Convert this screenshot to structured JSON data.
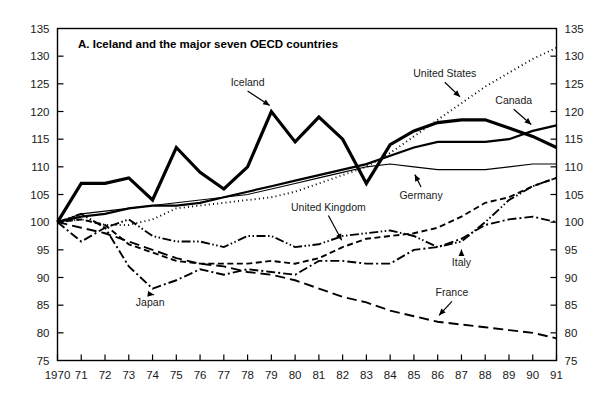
{
  "chart_data": {
    "type": "line",
    "title": "A.   Iceland and the major seven OECD countries",
    "title_prefix": "A.",
    "title_text": "Iceland and the major seven OECD countries",
    "xlabel": "",
    "ylabel": "",
    "xlim": [
      1970,
      1991
    ],
    "ylim": [
      75,
      135
    ],
    "grid": false,
    "legend_position": "inline-annotations",
    "y_ticks": [
      75,
      80,
      85,
      90,
      95,
      100,
      105,
      110,
      115,
      120,
      125,
      130,
      135
    ],
    "y_tick_labels": [
      "75",
      "80",
      "85",
      "90",
      "95",
      "100",
      "105",
      "110",
      "115",
      "120",
      "125",
      "130",
      "135"
    ],
    "y_axis_both_sides": true,
    "x": [
      1970,
      1971,
      1972,
      1973,
      1974,
      1975,
      1976,
      1977,
      1978,
      1979,
      1980,
      1981,
      1982,
      1983,
      1984,
      1985,
      1986,
      1987,
      1988,
      1989,
      1990,
      1991
    ],
    "x_tick_labels": [
      "1970",
      "71",
      "72",
      "73",
      "74",
      "75",
      "76",
      "77",
      "78",
      "79",
      "80",
      "81",
      "82",
      "83",
      "84",
      "85",
      "86",
      "87",
      "88",
      "89",
      "90",
      "91"
    ],
    "series": [
      {
        "name": "Iceland",
        "label": "Iceland",
        "style": "solid-thick",
        "stroke_width": 3.2,
        "dash": "none",
        "values": [
          100,
          107,
          107,
          108,
          104,
          113.5,
          109,
          106,
          110,
          120,
          114.5,
          119,
          115,
          107,
          114,
          116.5,
          118,
          118.5,
          118.5,
          117,
          115.5,
          113.5
        ],
        "annotation": {
          "text": "Iceland",
          "x": 1978.0,
          "y": 124.6
        }
      },
      {
        "name": "United States",
        "label": "United States",
        "style": "dotted",
        "stroke_width": 1.9,
        "dash": "1,3.2",
        "values": [
          100,
          100.5,
          99.5,
          99.5,
          100.5,
          102.5,
          103,
          103.5,
          104,
          104.5,
          105.5,
          107,
          108.5,
          110,
          112.5,
          115.5,
          118.5,
          121.5,
          124.5,
          127,
          129.5,
          131.5
        ],
        "annotation": {
          "text": "United States",
          "x": 1986.3,
          "y": 126.2
        }
      },
      {
        "name": "Canada",
        "label": "Canada",
        "style": "solid-medium",
        "stroke_width": 2.2,
        "dash": "none",
        "values": [
          100,
          101,
          101.5,
          102.5,
          103,
          103,
          103.5,
          104.5,
          105.5,
          106.5,
          107.5,
          108.5,
          109.5,
          110.5,
          112,
          113.5,
          114.5,
          114.5,
          114.5,
          115,
          116.5,
          117.5
        ],
        "annotation": {
          "text": "Canada",
          "x": 1989.2,
          "y": 121.3
        }
      },
      {
        "name": "Germany",
        "label": "Germany",
        "style": "solid-thin",
        "stroke_width": 1.1,
        "dash": "none",
        "values": [
          100,
          101.5,
          102,
          102.5,
          103,
          103.5,
          104,
          104.5,
          105,
          106,
          107,
          108,
          109,
          110,
          110.5,
          110,
          109.5,
          109.5,
          109.5,
          110,
          110.5,
          110.5
        ],
        "annotation": {
          "text": "Germany",
          "x": 1985.3,
          "y": 104.2
        }
      },
      {
        "name": "United Kingdom",
        "label": "United Kingdom",
        "style": "dashed-short",
        "stroke_width": 1.9,
        "dash": "6,3.5",
        "values": [
          100,
          100.5,
          99.5,
          96,
          94.5,
          93,
          92.5,
          92.5,
          92.5,
          93,
          92.5,
          93.5,
          95.5,
          97,
          97.5,
          98,
          99,
          101,
          103.5,
          104.5,
          106.5,
          108
        ],
        "annotation": {
          "text": "United Kingdom",
          "x": 1981.4,
          "y": 102.1
        }
      },
      {
        "name": "France",
        "label": "France",
        "style": "dashed-long",
        "stroke_width": 1.9,
        "dash": "10,5",
        "values": [
          100,
          99,
          98,
          96.5,
          95,
          93.5,
          92.5,
          92,
          91,
          90.5,
          89.5,
          88,
          86.5,
          85.5,
          84,
          83,
          82,
          81.5,
          81,
          80.5,
          80,
          79
        ],
        "annotation": {
          "text": "France",
          "x": 1986.6,
          "y": 86.6
        }
      },
      {
        "name": "Japan",
        "label": "Japan",
        "style": "dash-dot",
        "stroke_width": 1.9,
        "dash": "9,3,2,3",
        "values": [
          100,
          96.5,
          99,
          92,
          88,
          89.5,
          91.5,
          90.5,
          91.5,
          91,
          90.5,
          93,
          93,
          92.5,
          92.5,
          95,
          95.5,
          97,
          99.5,
          100.5,
          101,
          100
        ],
        "annotation": {
          "text": "Japan",
          "x": 1973.9,
          "y": 84.8
        }
      },
      {
        "name": "Italy",
        "label": "Italy",
        "style": "dash-dot-dot",
        "stroke_width": 1.9,
        "dash": "9,2.5,1.5,2.5,1.5,2.5",
        "values": [
          100,
          101.5,
          99,
          100.5,
          97.5,
          96.5,
          96.5,
          95.5,
          97.5,
          97.5,
          95.5,
          96,
          97.5,
          98,
          98.5,
          97.5,
          95.5,
          96.5,
          100,
          104,
          106.5,
          108
        ],
        "annotation": {
          "text": "Italy",
          "x": 1987.0,
          "y": 92.1
        }
      }
    ],
    "annotations": [
      {
        "label": "Iceland",
        "target_series": "Iceland"
      },
      {
        "label": "United States",
        "target_series": "United States"
      },
      {
        "label": "Canada",
        "target_series": "Canada"
      },
      {
        "label": "Germany",
        "target_series": "Germany"
      },
      {
        "label": "United Kingdom",
        "target_series": "United Kingdom"
      },
      {
        "label": "France",
        "target_series": "France"
      },
      {
        "label": "Japan",
        "target_series": "Japan"
      },
      {
        "label": "Italy",
        "target_series": "Italy"
      }
    ]
  },
  "colors": {
    "ink": "#000000",
    "background": "#ffffff",
    "tick_text": "#1a1a1a"
  }
}
